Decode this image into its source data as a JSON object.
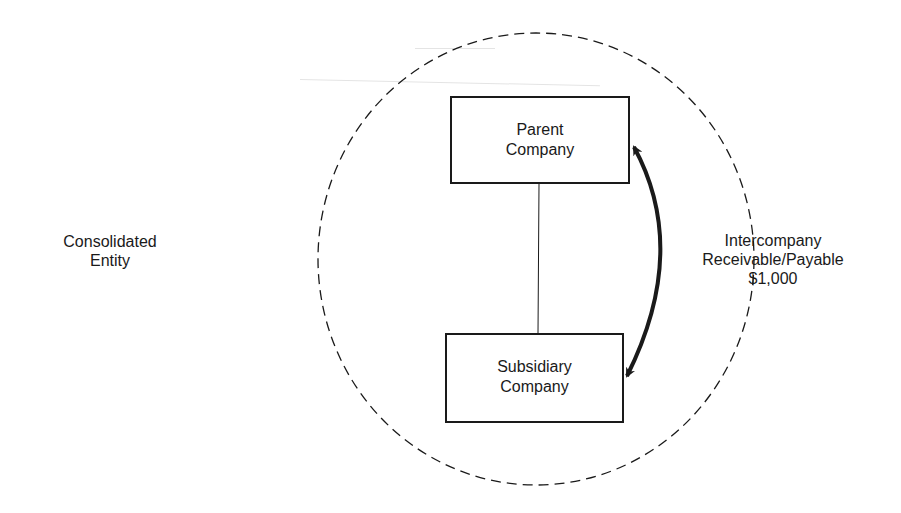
{
  "diagram": {
    "type": "consolidation-relationship",
    "boundary": {
      "label_lines": [
        "Consolidated",
        "Entity"
      ],
      "style": "dashed-circle"
    },
    "nodes": [
      {
        "id": "parent",
        "label_lines": [
          "Parent",
          "Company"
        ]
      },
      {
        "id": "subsidiary",
        "label_lines": [
          "Subsidiary",
          "Company"
        ]
      }
    ],
    "edges": [
      {
        "from": "parent",
        "to": "subsidiary",
        "style": "thin-line",
        "meaning": "ownership link"
      },
      {
        "from": "parent",
        "to": "subsidiary",
        "style": "thick-curved-double-arrow",
        "label_lines": [
          "Intercompany",
          "Receivable/Payable",
          "$1,000"
        ]
      }
    ]
  },
  "colors": {
    "ink": "#1a1a1a",
    "background": "#ffffff"
  }
}
